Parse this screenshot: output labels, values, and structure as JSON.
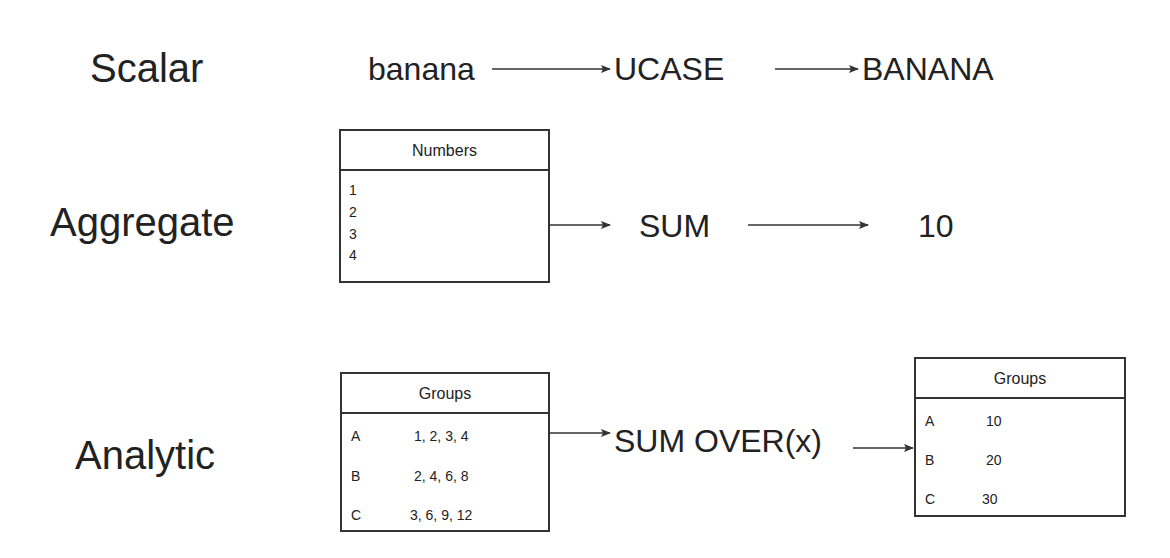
{
  "rows": {
    "scalar": {
      "label": "Scalar",
      "input": "banana",
      "function": "UCASE",
      "output": "BANANA"
    },
    "aggregate": {
      "label": "Aggregate",
      "table": {
        "title": "Numbers",
        "values": [
          "1",
          "2",
          "3",
          "4"
        ]
      },
      "function": "SUM",
      "output": "10"
    },
    "analytic": {
      "label": "Analytic",
      "input_table": {
        "title": "Groups",
        "rows": [
          {
            "key": "A",
            "value": "1, 2, 3, 4"
          },
          {
            "key": "B",
            "value": "2, 4, 6, 8"
          },
          {
            "key": "C",
            "value": "3, 6, 9, 12"
          }
        ]
      },
      "function": "SUM OVER(x)",
      "output_table": {
        "title": "Groups",
        "rows": [
          {
            "key": "A",
            "value": "10"
          },
          {
            "key": "B",
            "value": "20"
          },
          {
            "key": "C",
            "value": "30"
          }
        ]
      }
    }
  },
  "colors": {
    "text": "#222222",
    "line": "#333333",
    "background": "#ffffff"
  }
}
